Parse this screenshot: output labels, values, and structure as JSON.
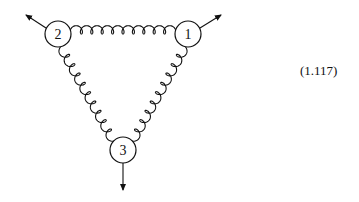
{
  "diagram": {
    "type": "feynman-diagram",
    "vertices": [
      {
        "id": "1",
        "label": "1",
        "cx": 188,
        "cy": 34,
        "r": 13
      },
      {
        "id": "2",
        "label": "2",
        "cx": 58,
        "cy": 34,
        "r": 13
      },
      {
        "id": "3",
        "label": "3",
        "cx": 123,
        "cy": 150,
        "r": 13
      }
    ],
    "propagators": [
      {
        "from": "2",
        "to": "1",
        "kind": "gluon",
        "loops": 10
      },
      {
        "from": "1",
        "to": "3",
        "kind": "gluon",
        "loops": 10
      },
      {
        "from": "2",
        "to": "3",
        "kind": "gluon",
        "loops": 10
      }
    ],
    "external_arrows": [
      {
        "from_vertex": "2",
        "direction": "upper-left"
      },
      {
        "from_vertex": "1",
        "direction": "upper-right"
      },
      {
        "from_vertex": "3",
        "direction": "down"
      }
    ],
    "colors": {
      "stroke": "#111111",
      "background": "#ffffff"
    }
  },
  "equation_label": "(1.117)"
}
